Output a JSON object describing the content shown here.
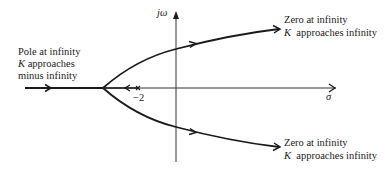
{
  "diagram": {
    "type": "root-locus",
    "axes": {
      "real_label": "σ",
      "imag_label": "jω",
      "tick_label": "−2"
    },
    "left_annotation": {
      "line1": "Pole at infinity",
      "line2_K": "K",
      "line2_rest": " approaches",
      "line3": "minus infinity"
    },
    "upper_annotation": {
      "line1": "Zero at infinity",
      "line2_K": "K",
      "line2_rest": "  approaches infinity"
    },
    "lower_annotation": {
      "line1": "Zero at infinity",
      "line2_K": "K",
      "line2_rest": "  approaches infinity"
    },
    "elements": {
      "pole_marker": "×",
      "breakaway_point": "left of −2"
    },
    "colors": {
      "stroke": "#1a1a1a",
      "axis": "#333333",
      "background": "#ffffff"
    }
  }
}
